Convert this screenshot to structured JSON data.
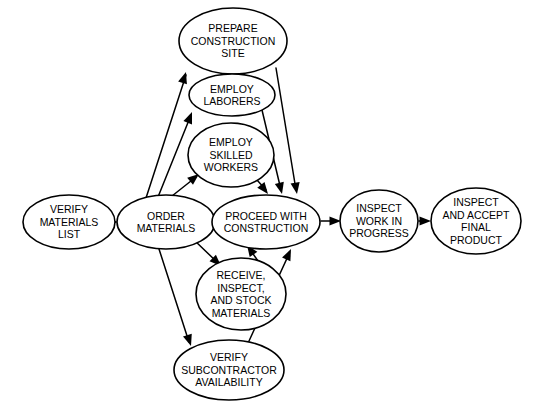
{
  "diagram": {
    "background_color": "#ffffff",
    "stroke_color": "#000000",
    "text_color": "#000000",
    "nodes": [
      {
        "id": "verify-materials-list",
        "lines": [
          "VERIFY",
          "MATERIALS",
          "LIST"
        ],
        "cx": 69,
        "cy": 222,
        "rx": 46,
        "ry": 27,
        "font_size": 10.5,
        "line_height": 12.5
      },
      {
        "id": "order-materials",
        "lines": [
          "ORDER",
          "MATERIALS"
        ],
        "cx": 166,
        "cy": 222,
        "rx": 49,
        "ry": 27,
        "font_size": 10.5,
        "line_height": 12.5
      },
      {
        "id": "prepare-construction-site",
        "lines": [
          "PREPARE",
          "CONSTRUCTION",
          "SITE"
        ],
        "cx": 233,
        "cy": 41,
        "rx": 54,
        "ry": 33,
        "font_size": 10.5,
        "line_height": 12.5
      },
      {
        "id": "employ-laborers",
        "lines": [
          "EMPLOY",
          "LABORERS"
        ],
        "cx": 232,
        "cy": 95,
        "rx": 43,
        "ry": 21,
        "font_size": 10.5,
        "line_height": 12.5
      },
      {
        "id": "employ-skilled-workers",
        "lines": [
          "EMPLOY",
          "SKILLED",
          "WORKERS"
        ],
        "cx": 231,
        "cy": 155,
        "rx": 43,
        "ry": 32,
        "font_size": 10.5,
        "line_height": 12.5
      },
      {
        "id": "proceed-with-construction",
        "lines": [
          "PROCEED WITH",
          "CONSTRUCTION"
        ],
        "cx": 266,
        "cy": 222,
        "rx": 54,
        "ry": 27,
        "font_size": 10.5,
        "line_height": 12.5
      },
      {
        "id": "receive-inspect-stock-materials",
        "lines": [
          "RECEIVE,",
          "INSPECT,",
          "AND STOCK",
          "MATERIALS"
        ],
        "cx": 241,
        "cy": 294,
        "rx": 45,
        "ry": 36,
        "font_size": 10.5,
        "line_height": 12.5
      },
      {
        "id": "verify-subcontractor-availability",
        "lines": [
          "VERIFY",
          "SUBCONTRACTOR",
          "AVAILABILITY"
        ],
        "cx": 229,
        "cy": 370,
        "rx": 55,
        "ry": 30,
        "font_size": 10.5,
        "line_height": 12.5
      },
      {
        "id": "inspect-work-in-progress",
        "lines": [
          "INSPECT",
          "WORK IN",
          "PROGRESS"
        ],
        "cx": 379,
        "cy": 221,
        "rx": 39,
        "ry": 31,
        "font_size": 10.5,
        "line_height": 12.5
      },
      {
        "id": "inspect-and-accept-final-product",
        "lines": [
          "INSPECT",
          "AND ACCEPT",
          "FINAL",
          "PRODUCT"
        ],
        "cx": 476,
        "cy": 221,
        "rx": 45,
        "ry": 33,
        "font_size": 10.5,
        "line_height": 12.5
      }
    ],
    "edges": [
      {
        "id": "verify-list-to-order",
        "from": "verify-materials-list",
        "to": "order-materials",
        "path": "M 116 222 L 112 222",
        "x1": 112,
        "y1": 222,
        "x2": 117,
        "y2": 222
      },
      {
        "id": "order-to-prepare-site",
        "from": "order-materials",
        "to": "prepare-construction-site",
        "path": "M 146 198 L 186 75",
        "x1": 146,
        "y1": 198,
        "x2": 186,
        "y2": 72
      },
      {
        "id": "order-to-employ-laborers",
        "from": "order-materials",
        "to": "employ-laborers",
        "path": "M 158 197 L 191 115",
        "x1": 158,
        "y1": 197,
        "x2": 192,
        "y2": 112
      },
      {
        "id": "order-to-employ-skilled",
        "from": "order-materials",
        "to": "employ-skilled-workers",
        "path": "M 172 196 L 196 177",
        "x1": 172,
        "y1": 196,
        "x2": 199,
        "y2": 174
      },
      {
        "id": "order-to-receive-inspect",
        "from": "order-materials",
        "to": "receive-inspect-stock-materials",
        "path": "M 194 240 L 218 263",
        "x1": 194,
        "y1": 240,
        "x2": 221,
        "y2": 266
      },
      {
        "id": "order-to-verify-subcontractor",
        "from": "order-materials",
        "to": "verify-subcontractor-availability",
        "path": "M 159 249 L 189 342",
        "x1": 159,
        "y1": 249,
        "x2": 191,
        "y2": 346
      },
      {
        "id": "prepare-site-to-proceed",
        "from": "prepare-construction-site",
        "to": "proceed-with-construction",
        "path": "M 276 68 L 296 190",
        "x1": 276,
        "y1": 68,
        "x2": 297,
        "y2": 194
      },
      {
        "id": "employ-laborers-to-proceed",
        "from": "employ-laborers",
        "to": "proceed-with-construction",
        "path": "M 262 110 L 281 190",
        "x1": 262,
        "y1": 110,
        "x2": 282,
        "y2": 194
      },
      {
        "id": "employ-skilled-to-proceed",
        "from": "employ-skilled-workers",
        "to": "proceed-with-construction",
        "path": "M 257 180 L 266 190",
        "x1": 257,
        "y1": 180,
        "x2": 268,
        "y2": 194
      },
      {
        "id": "receive-inspect-to-proceed",
        "from": "receive-inspect-stock-materials",
        "to": "proceed-with-construction",
        "path": "M 258 261 L 249 248",
        "x1": 258,
        "y1": 261,
        "x2": 247,
        "y2": 245
      },
      {
        "id": "verify-subcontractor-to-proceed",
        "from": "verify-subcontractor-availability",
        "to": "proceed-with-construction",
        "path": "M 249 341 L 289 254",
        "x1": 249,
        "y1": 341,
        "x2": 291,
        "y2": 249
      },
      {
        "id": "proceed-to-inspect-work",
        "from": "proceed-with-construction",
        "to": "inspect-work-in-progress",
        "path": "M 321 221 L 336 221",
        "x1": 336,
        "y1": 221,
        "x2": 341,
        "y2": 221
      },
      {
        "id": "inspect-work-to-final-product",
        "from": "inspect-work-in-progress",
        "to": "inspect-and-accept-final-product",
        "path": "M 419 221 L 426 221",
        "x1": 426,
        "y1": 221,
        "x2": 431,
        "y2": 221
      }
    ]
  }
}
